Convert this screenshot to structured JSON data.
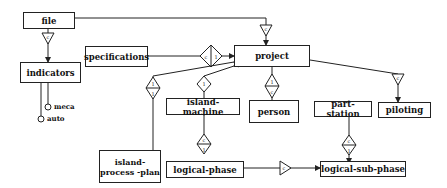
{
  "diagram": {
    "entities": {
      "file": "file",
      "indicators": "indicators",
      "specifications": "specifications",
      "project": "project",
      "island_machine": "island-machine",
      "person": "person",
      "part_station": "part-station",
      "piloting": "piloting",
      "island_process_plan": "island-process -plan",
      "logical_phase": "logical-phase",
      "logical_sub_phase": "logical-sub-phase"
    },
    "attributes": {
      "meca": "meca",
      "auto": "auto"
    },
    "relations": [
      {
        "from": "file",
        "to": "indicators",
        "type": "triangle",
        "label": "c"
      },
      {
        "from": "file",
        "to": "project",
        "type": "triangle",
        "label": "c"
      },
      {
        "from": "project",
        "to": "specifications",
        "type": "diamond",
        "label": "c | 1"
      },
      {
        "from": "project",
        "to": "island-process-plan",
        "type": "diamond",
        "label": "1 / 1"
      },
      {
        "from": "project",
        "to": "island-machine",
        "type": "diamond",
        "label": "1 / 1"
      },
      {
        "from": "project",
        "to": "person",
        "type": "diamond",
        "label": "1 / c"
      },
      {
        "from": "project",
        "to": "piloting",
        "type": "triangle",
        "label": "c"
      },
      {
        "from": "island-machine",
        "to": "logical-phase",
        "type": "diamond",
        "label": "c / 1"
      },
      {
        "from": "part-station",
        "to": "logical-sub-phase",
        "type": "diamond",
        "label": "c / 1"
      },
      {
        "from": "logical-phase",
        "to": "logical-sub-phase",
        "type": "triangle",
        "label": "c"
      }
    ]
  }
}
